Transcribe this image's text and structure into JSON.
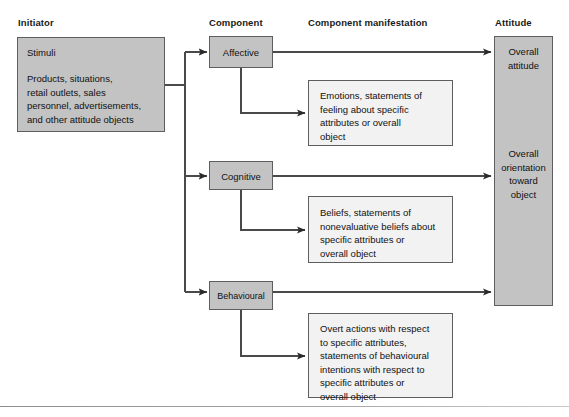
{
  "headers": [
    {
      "label": "Initiator"
    },
    {
      "label": "Component"
    },
    {
      "label": "Component manifestation"
    },
    {
      "label": "Attitude"
    }
  ],
  "initiator": {
    "title": "Stimuli",
    "body": "Products, situations,\nretail outlets, sales\npersonnel, advertisements,\nand other attitude objects"
  },
  "components": [
    {
      "label": "Affective"
    },
    {
      "label": "Cognitive"
    },
    {
      "label": "Behavioural"
    }
  ],
  "manifestations": [
    {
      "text": "Emotions, statements of\nfeeling about specific\nattributes or overall\nobject"
    },
    {
      "text": "Beliefs, statements of\nnonevaluative beliefs about\nspecific attributes or\noverall object"
    },
    {
      "text": "Overt actions with respect\nto specific attributes,\nstatements of behavioural\nintentions with respect to\nspecific attributes or\noverall object"
    }
  ],
  "attitude": {
    "top_label": "Overall\nattitude",
    "mid_label": "Overall\norientation\ntoward\nobject"
  },
  "colors": {
    "box_fill_gray": "#c3c3c3",
    "box_fill_light": "#f2f2f2",
    "box_border": "#5e5e5e",
    "line": "#4a4a4a",
    "text": "#111111"
  }
}
